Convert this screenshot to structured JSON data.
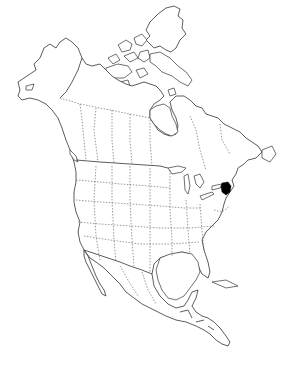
{
  "map": {
    "title": "North America",
    "style": "outline",
    "regions": [
      "Alaska",
      "Canada",
      "Greenland",
      "United States",
      "Mexico",
      "Central America"
    ],
    "highlighted_region": {
      "country": "United States",
      "region": "Vermont / New Hampshire (northeast)",
      "color": "#000000",
      "approx_center": [
        226,
        188
      ]
    },
    "colors": {
      "background": "#ffffff",
      "outline": "#333333",
      "highlight": "#000000"
    },
    "border_styles": {
      "coastline": "solid",
      "international": "solid",
      "state_province": "dashed"
    }
  }
}
